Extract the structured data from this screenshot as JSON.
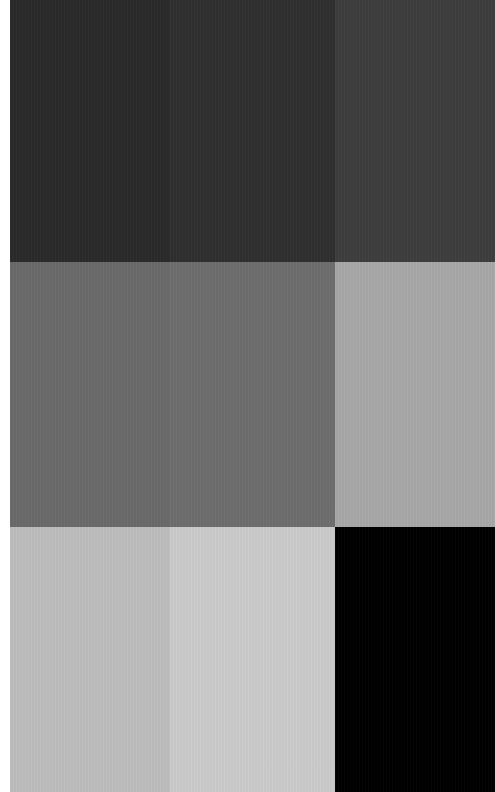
{
  "image": {
    "description": "3x3 grid of grayscale tone swatches",
    "background": "#ffffff",
    "swatches": [
      {
        "row": 0,
        "col": 0,
        "color": "#2a2a2a"
      },
      {
        "row": 0,
        "col": 1,
        "color": "#2f2f2f"
      },
      {
        "row": 0,
        "col": 2,
        "color": "#3d3d3d"
      },
      {
        "row": 1,
        "col": 0,
        "color": "#6a6a6a"
      },
      {
        "row": 1,
        "col": 1,
        "color": "#6e6e6e"
      },
      {
        "row": 1,
        "col": 2,
        "color": "#a8a8a8"
      },
      {
        "row": 2,
        "col": 0,
        "color": "#bdbdbd"
      },
      {
        "row": 2,
        "col": 1,
        "color": "#cbcbcb"
      },
      {
        "row": 2,
        "col": 2,
        "color": "#000000"
      }
    ]
  }
}
